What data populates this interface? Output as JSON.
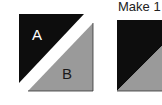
{
  "caption": {
    "text": "Make 1"
  },
  "figure_left": {
    "triangle_a": {
      "label": "A",
      "color": "#0d0d0d",
      "label_color": "#ffffff"
    },
    "triangle_b": {
      "label": "B",
      "color": "#9a9a9a",
      "label_color": "#1a1a1a"
    }
  },
  "figure_right": {
    "top_color": "#0d0d0d",
    "bottom_color": "#9a9a9a"
  }
}
